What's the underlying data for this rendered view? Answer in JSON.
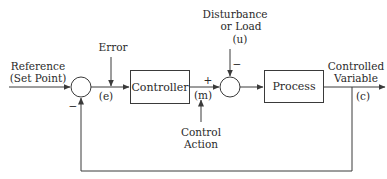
{
  "diagram": {
    "type": "feedback-control-block-diagram",
    "blocks": {
      "controller": "Controller",
      "process": "Process"
    },
    "labels": {
      "reference_line1": "Reference",
      "reference_line2": "(Set Point)",
      "error": "Error",
      "error_symbol": "(e)",
      "plus_sign": "+",
      "m_symbol": "(m)",
      "control_line1": "Control",
      "control_line2": "Action",
      "disturbance_line1": "Disturbance",
      "disturbance_line2": "or Load",
      "u_symbol": "(u)",
      "disturbance_minus": "−",
      "feedback_minus": "−",
      "output_line1": "Controlled",
      "output_line2": "Variable",
      "c_symbol": "(c)"
    },
    "colors": {
      "line": "#3a3a3a",
      "text": "#2a2a2a",
      "background": "#ffffff"
    }
  }
}
